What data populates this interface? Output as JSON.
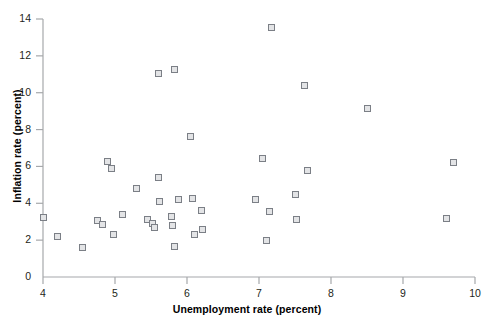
{
  "chart_data": {
    "type": "scatter",
    "title": "",
    "xlabel": "Unemployment rate (percent)",
    "ylabel": "Inflation rate (percent)",
    "xlim": [
      4,
      10
    ],
    "ylim": [
      0,
      14
    ],
    "xticks": [
      4,
      5,
      6,
      7,
      8,
      9,
      10
    ],
    "yticks": [
      0,
      2,
      4,
      6,
      8,
      10,
      12,
      14
    ],
    "grid": false,
    "legend": null,
    "marker": {
      "shape": "square-open",
      "fill_color": "#e3e4e6",
      "edge_color": "#7b7f86",
      "size_px": 7
    },
    "axis_color": "#a6a8ab",
    "points": [
      {
        "x": 4.0,
        "y": 3.25
      },
      {
        "x": 4.2,
        "y": 2.2
      },
      {
        "x": 4.55,
        "y": 1.6
      },
      {
        "x": 4.75,
        "y": 3.05
      },
      {
        "x": 4.82,
        "y": 2.85
      },
      {
        "x": 4.9,
        "y": 6.25
      },
      {
        "x": 4.95,
        "y": 5.9
      },
      {
        "x": 4.98,
        "y": 2.3
      },
      {
        "x": 5.1,
        "y": 3.4
      },
      {
        "x": 5.3,
        "y": 4.8
      },
      {
        "x": 5.45,
        "y": 3.1
      },
      {
        "x": 5.52,
        "y": 2.9
      },
      {
        "x": 5.55,
        "y": 2.7
      },
      {
        "x": 5.6,
        "y": 11.05
      },
      {
        "x": 5.6,
        "y": 5.4
      },
      {
        "x": 5.62,
        "y": 4.1
      },
      {
        "x": 5.83,
        "y": 11.25
      },
      {
        "x": 5.78,
        "y": 3.3
      },
      {
        "x": 5.8,
        "y": 2.8
      },
      {
        "x": 5.88,
        "y": 4.2
      },
      {
        "x": 5.82,
        "y": 1.65
      },
      {
        "x": 6.05,
        "y": 7.6
      },
      {
        "x": 6.08,
        "y": 4.25
      },
      {
        "x": 6.1,
        "y": 2.3
      },
      {
        "x": 6.2,
        "y": 3.6
      },
      {
        "x": 6.22,
        "y": 2.6
      },
      {
        "x": 6.95,
        "y": 4.2
      },
      {
        "x": 7.05,
        "y": 6.45
      },
      {
        "x": 7.18,
        "y": 13.55
      },
      {
        "x": 7.15,
        "y": 3.55
      },
      {
        "x": 7.1,
        "y": 2.0
      },
      {
        "x": 7.5,
        "y": 4.45
      },
      {
        "x": 7.52,
        "y": 3.1
      },
      {
        "x": 7.63,
        "y": 10.4
      },
      {
        "x": 7.68,
        "y": 5.8
      },
      {
        "x": 8.5,
        "y": 9.15
      },
      {
        "x": 9.7,
        "y": 6.2
      },
      {
        "x": 9.6,
        "y": 3.2
      }
    ]
  }
}
